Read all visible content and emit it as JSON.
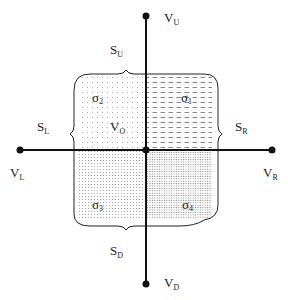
{
  "diagram": {
    "axes": {
      "vertical": {
        "top_label": "V",
        "top_sub": "U",
        "bottom_label": "V",
        "bottom_sub": "D"
      },
      "horizontal": {
        "left_label": "V",
        "left_sub": "L",
        "right_label": "V",
        "right_sub": "R"
      }
    },
    "center_label": {
      "main": "V",
      "sub": "O"
    },
    "braces": {
      "up": {
        "main": "S",
        "sub": "U"
      },
      "down": {
        "main": "S",
        "sub": "D"
      },
      "left": {
        "main": "S",
        "sub": "L"
      },
      "right": {
        "main": "S",
        "sub": "R"
      }
    },
    "regions": [
      {
        "id": "sigma1",
        "main": "σ",
        "sub": "1",
        "quadrant": "top-right",
        "pattern": "dashes"
      },
      {
        "id": "sigma2",
        "main": "σ",
        "sub": "2",
        "quadrant": "top-left",
        "pattern": "sparse-dots"
      },
      {
        "id": "sigma3",
        "main": "σ",
        "sub": "3",
        "quadrant": "bottom-left",
        "pattern": "dots"
      },
      {
        "id": "sigma4",
        "main": "σ",
        "sub": "4",
        "quadrant": "bottom-right",
        "pattern": "dense-dots"
      }
    ],
    "colors": {
      "line": "#111111",
      "text": "#222222",
      "pattern": "#888888"
    }
  }
}
